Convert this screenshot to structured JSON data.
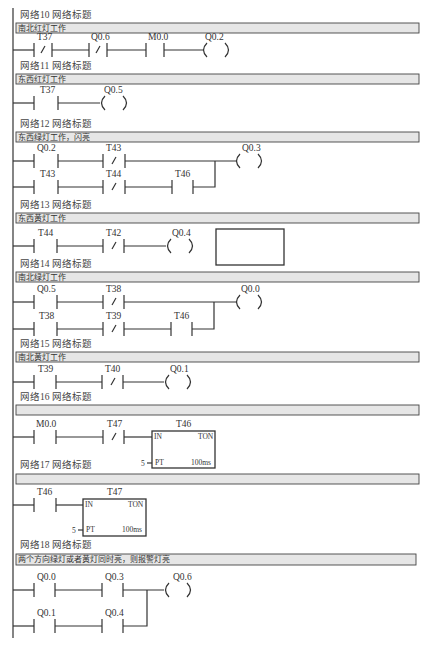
{
  "diagram": {
    "type": "PLC ladder diagram",
    "networks": [
      {
        "id": "network-10",
        "header": "网络10   网络标题",
        "comment": "南北红灯工作",
        "rungs": [
          {
            "elements": [
              {
                "type": "NC",
                "label": "T37"
              },
              {
                "type": "NC",
                "label": "Q0.6"
              },
              {
                "type": "NO",
                "label": "M0.0"
              },
              {
                "type": "coil",
                "label": "Q0.2"
              }
            ]
          }
        ]
      },
      {
        "id": "network-11",
        "header": "网络11   网络标题",
        "comment": "东西红灯工作",
        "rungs": [
          {
            "elements": [
              {
                "type": "NO",
                "label": "T37"
              },
              {
                "type": "coil",
                "label": "Q0.5"
              }
            ]
          }
        ]
      },
      {
        "id": "network-12",
        "header": "网络12   网络标题",
        "comment": "东西绿灯工作，闪亮",
        "rungs": [
          {
            "elements": [
              {
                "type": "NO",
                "label": "Q0.2"
              },
              {
                "type": "NC",
                "label": "T43"
              },
              {
                "type": "coil",
                "label": "Q0.3"
              }
            ]
          },
          {
            "elements": [
              {
                "type": "NO",
                "label": "T43"
              },
              {
                "type": "NC",
                "label": "T44"
              },
              {
                "type": "NO",
                "label": "T46"
              }
            ]
          }
        ]
      },
      {
        "id": "network-13",
        "header": "网络13   网络标题",
        "comment": "东西黄灯工作",
        "rungs": [
          {
            "elements": [
              {
                "type": "NO",
                "label": "T44"
              },
              {
                "type": "NC",
                "label": "T42"
              },
              {
                "type": "coil",
                "label": "Q0.4"
              }
            ]
          }
        ]
      },
      {
        "id": "network-14",
        "header": "网络14   网络标题",
        "comment": "南北绿灯工作",
        "rungs": [
          {
            "elements": [
              {
                "type": "NO",
                "label": "Q0.5"
              },
              {
                "type": "NC",
                "label": "T38"
              },
              {
                "type": "coil",
                "label": "Q0.0"
              }
            ]
          },
          {
            "elements": [
              {
                "type": "NO",
                "label": "T38"
              },
              {
                "type": "NC",
                "label": "T39"
              },
              {
                "type": "NO",
                "label": "T46"
              }
            ]
          }
        ]
      },
      {
        "id": "network-15",
        "header": "网络15   网络标题",
        "comment": "南北黄灯工作",
        "rungs": [
          {
            "elements": [
              {
                "type": "NO",
                "label": "T39"
              },
              {
                "type": "NC",
                "label": "T40"
              },
              {
                "type": "coil",
                "label": "Q0.1"
              }
            ]
          }
        ]
      },
      {
        "id": "network-16",
        "header": "网络16   网络标题",
        "comment": "",
        "rungs": [
          {
            "elements": [
              {
                "type": "NO",
                "label": "M0.0"
              },
              {
                "type": "NC",
                "label": "T47"
              },
              {
                "type": "timer",
                "label": "T46",
                "kind": "TON",
                "in": "IN",
                "pt": "PT",
                "pt_value": "5",
                "base": "100ms"
              }
            ]
          }
        ]
      },
      {
        "id": "network-17",
        "header": "网络17   网络标题",
        "comment": "",
        "rungs": [
          {
            "elements": [
              {
                "type": "NO",
                "label": "T46"
              },
              {
                "type": "timer",
                "label": "T47",
                "kind": "TON",
                "in": "IN",
                "pt": "PT",
                "pt_value": "5",
                "base": "100ms"
              }
            ]
          }
        ]
      },
      {
        "id": "network-18",
        "header": "网络18   网络标题",
        "comment": "两个方向绿灯或者黄灯同时亮，则报警灯亮",
        "rungs": [
          {
            "elements": [
              {
                "type": "NO",
                "label": "Q0.0"
              },
              {
                "type": "NO",
                "label": "Q0.3"
              },
              {
                "type": "coil",
                "label": "Q0.6"
              }
            ]
          },
          {
            "elements": [
              {
                "type": "NO",
                "label": "Q0.1"
              },
              {
                "type": "NO",
                "label": "Q0.4"
              }
            ]
          }
        ]
      }
    ]
  },
  "text": {
    "n10_header": "网络10   网络标题",
    "n10_comment": "南北红灯工作",
    "n10_c1": "T37",
    "n10_c2": "Q0.6",
    "n10_c3": "M0.0",
    "n10_coil": "Q0.2",
    "n11_header": "网络11   网络标题",
    "n11_comment": "东西红灯工作",
    "n11_c1": "T37",
    "n11_coil": "Q0.5",
    "n12_header": "网络12   网络标题",
    "n12_comment": "东西绿灯工作，闪亮",
    "n12_c1": "Q0.2",
    "n12_c2": "T43",
    "n12_coil": "Q0.3",
    "n12_c3": "T43",
    "n12_c4": "T44",
    "n12_c5": "T46",
    "n13_header": "网络13   网络标题",
    "n13_comment": "东西黄灯工作",
    "n13_c1": "T44",
    "n13_c2": "T42",
    "n13_coil": "Q0.4",
    "n14_header": "网络14   网络标题",
    "n14_comment": "南北绿灯工作",
    "n14_c1": "Q0.5",
    "n14_c2": "T38",
    "n14_coil": "Q0.0",
    "n14_c3": "T38",
    "n14_c4": "T39",
    "n14_c5": "T46",
    "n15_header": "网络15   网络标题",
    "n15_comment": "南北黄灯工作",
    "n15_c1": "T39",
    "n15_c2": "T40",
    "n15_coil": "Q0.1",
    "n16_header": "网络16   网络标题",
    "n16_c1": "M0.0",
    "n16_c2": "T47",
    "n16_timer": "T46",
    "n16_in": "IN",
    "n16_ton": "TON",
    "n16_pt": "PT",
    "n16_ptval": "5",
    "n16_base": "100ms",
    "n17_header": "网络17   网络标题",
    "n17_c1": "T46",
    "n17_timer": "T47",
    "n17_in": "IN",
    "n17_ton": "TON",
    "n17_pt": "PT",
    "n17_ptval": "5",
    "n17_base": "100ms",
    "n18_header": "网络18   网络标题",
    "n18_comment": "两个方向绿灯或者黄灯同时亮，则报警灯亮",
    "n18_c1": "Q0.0",
    "n18_c2": "Q0.3",
    "n18_coil": "Q0.6",
    "n18_c3": "Q0.1",
    "n18_c4": "Q0.4"
  }
}
